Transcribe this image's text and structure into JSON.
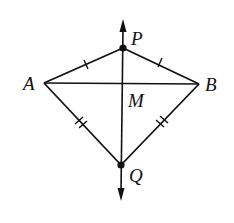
{
  "diagram": {
    "type": "kite_with_perpendicular_bisector",
    "stroke_color": "#111111",
    "background": "#ffffff",
    "points": {
      "P": {
        "label": "P",
        "x": 123,
        "y": 48
      },
      "A": {
        "label": "A",
        "x": 44,
        "y": 83
      },
      "B": {
        "label": "B",
        "x": 199,
        "y": 84
      },
      "Q": {
        "label": "Q",
        "x": 121,
        "y": 165
      },
      "M": {
        "label": "M"
      }
    },
    "segments": [
      {
        "from": "A",
        "to": "P",
        "tick_marks": 1
      },
      {
        "from": "P",
        "to": "B",
        "tick_marks": 1
      },
      {
        "from": "A",
        "to": "Q",
        "tick_marks": 2
      },
      {
        "from": "B",
        "to": "Q",
        "tick_marks": 2
      },
      {
        "from": "A",
        "to": "B",
        "tick_marks": 0
      }
    ],
    "line": {
      "through": [
        "P",
        "Q"
      ],
      "arrows": "both",
      "description": "line PQ with arrowheads at both ends"
    },
    "labels": {
      "P": "P",
      "A": "A",
      "B": "B",
      "M": "M",
      "Q": "Q"
    }
  }
}
